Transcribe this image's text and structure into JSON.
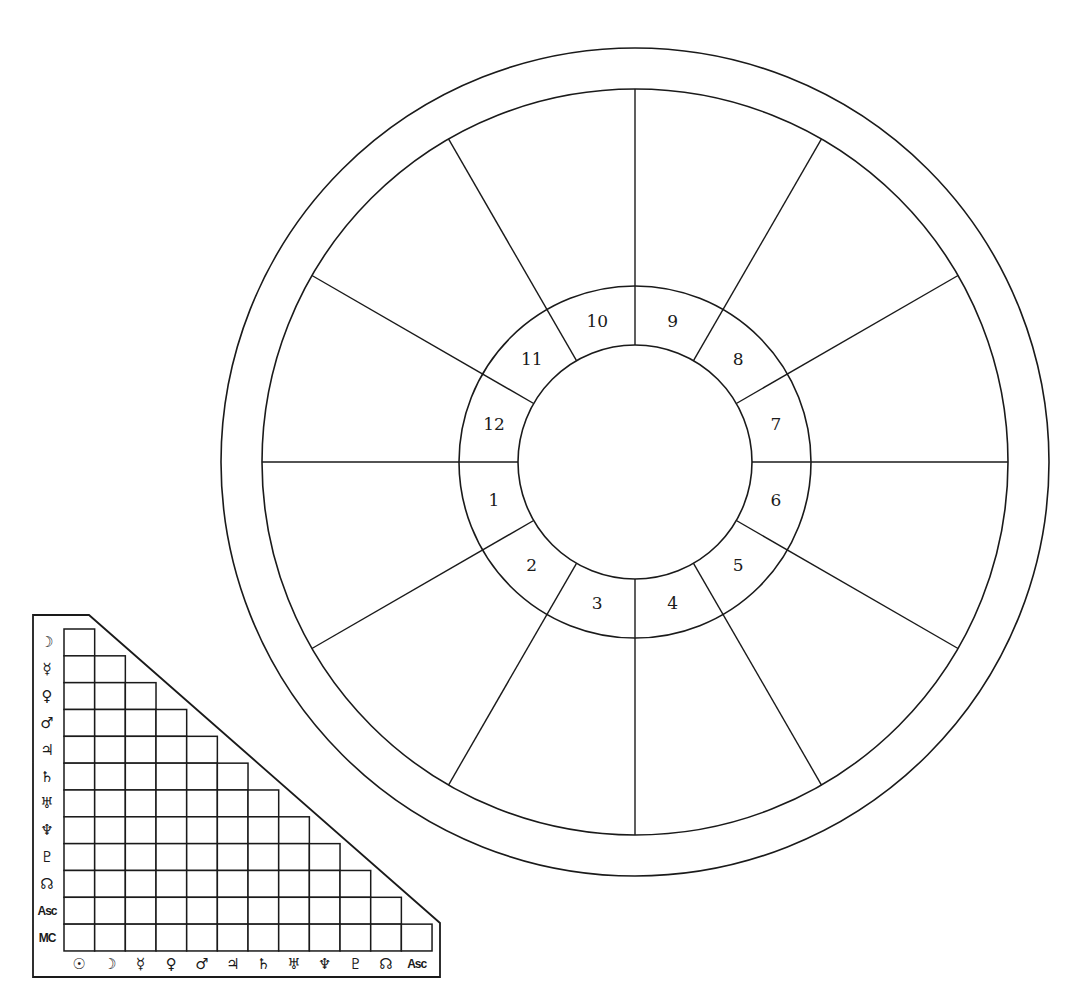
{
  "wheel": {
    "center": [
      635,
      462
    ],
    "radii": {
      "outer": 414,
      "sign_ring": 373,
      "house_ring_outer": 176,
      "house_ring_inner": 117
    },
    "spoke_angles_deg": [
      0,
      30,
      60,
      90,
      120,
      150,
      180,
      210,
      240,
      270,
      300,
      330
    ],
    "house_label_radius": 146,
    "houses": [
      {
        "number": "1",
        "angle_deg": 195
      },
      {
        "number": "2",
        "angle_deg": 225
      },
      {
        "number": "3",
        "angle_deg": 255
      },
      {
        "number": "4",
        "angle_deg": 285
      },
      {
        "number": "5",
        "angle_deg": 315
      },
      {
        "number": "6",
        "angle_deg": 345
      },
      {
        "number": "7",
        "angle_deg": 15
      },
      {
        "number": "8",
        "angle_deg": 45
      },
      {
        "number": "9",
        "angle_deg": 75
      },
      {
        "number": "10",
        "angle_deg": 105
      },
      {
        "number": "11",
        "angle_deg": 135
      },
      {
        "number": "12",
        "angle_deg": 165
      }
    ],
    "line_color": "#1a1a1a"
  },
  "aspect_grid": {
    "frame": {
      "left": 33,
      "top": 615,
      "right": 440,
      "bottom": 977,
      "diagonal_start_x": 89,
      "diagonal_end_y": 923
    },
    "grid_origin": [
      64,
      629
    ],
    "cell_width": 30.67,
    "cell_height": 26.83,
    "row_label_x": 47,
    "col_label_y": 964,
    "row_labels": [
      {
        "symbol": "☽",
        "name": "moon-icon"
      },
      {
        "symbol": "☿",
        "name": "mercury-icon"
      },
      {
        "symbol": "♀",
        "name": "venus-icon"
      },
      {
        "symbol": "♂",
        "name": "mars-icon"
      },
      {
        "symbol": "♃",
        "name": "jupiter-icon"
      },
      {
        "symbol": "♄",
        "name": "saturn-icon"
      },
      {
        "symbol": "♅",
        "name": "uranus-icon"
      },
      {
        "symbol": "♆",
        "name": "neptune-icon"
      },
      {
        "symbol": "♇",
        "name": "pluto-icon"
      },
      {
        "symbol": "☊",
        "name": "north-node-icon"
      },
      {
        "symbol": "Asc",
        "name": "ascendant-label",
        "small": true
      },
      {
        "symbol": "MC",
        "name": "midheaven-label",
        "small": true
      }
    ],
    "col_labels": [
      {
        "symbol": "☉",
        "name": "sun-icon"
      },
      {
        "symbol": "☽",
        "name": "moon-icon"
      },
      {
        "symbol": "☿",
        "name": "mercury-icon"
      },
      {
        "symbol": "♀",
        "name": "venus-icon"
      },
      {
        "symbol": "♂",
        "name": "mars-icon"
      },
      {
        "symbol": "♃",
        "name": "jupiter-icon"
      },
      {
        "symbol": "♄",
        "name": "saturn-icon"
      },
      {
        "symbol": "♅",
        "name": "uranus-icon"
      },
      {
        "symbol": "♆",
        "name": "neptune-icon"
      },
      {
        "symbol": "♇",
        "name": "pluto-icon"
      },
      {
        "symbol": "☊",
        "name": "north-node-icon"
      },
      {
        "symbol": "Asc",
        "name": "ascendant-label",
        "small": true
      }
    ],
    "cells": "empty"
  }
}
